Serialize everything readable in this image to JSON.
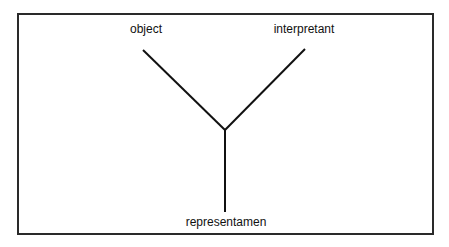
{
  "diagram": {
    "type": "semiotic-triad",
    "nodes": {
      "object": "object",
      "interpretant": "interpretant",
      "representamen": "representamen"
    },
    "colors": {
      "line": "#111111",
      "frame": "#2a2a2a",
      "background": "#ffffff"
    }
  }
}
